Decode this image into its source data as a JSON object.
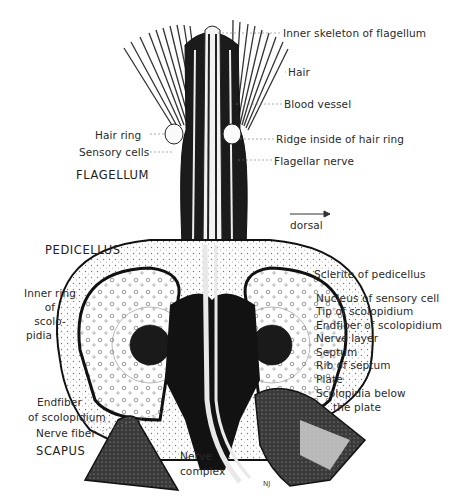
{
  "figure": {
    "colors": {
      "ink": "#1a1a1a",
      "paper": "#ffffff",
      "label": "#2a2a2a",
      "leader": "#555555"
    },
    "section_labels": {
      "flagellum": "FLAGELLUM",
      "pedicellus": "PEDICELLUS",
      "scapus": "SCAPUS"
    },
    "orientation": {
      "label": "dorsal",
      "arrow": "right-arrow"
    },
    "right_labels": [
      {
        "text": "Inner skeleton of flagellum"
      },
      {
        "text": "Hair"
      },
      {
        "text": "Blood vessel"
      },
      {
        "text": "Ridge inside of hair ring"
      },
      {
        "text": "Flagellar nerve"
      },
      {
        "text": "Sclerite of pedicellus"
      },
      {
        "text": "Nucleus of sensory cell"
      },
      {
        "text": "Tip of scolopidium"
      },
      {
        "text": "Endfiber of scolopidium"
      },
      {
        "text": "Nerve layer"
      },
      {
        "text": "Septum"
      },
      {
        "text": "Rib of septum"
      },
      {
        "text": "Plate"
      },
      {
        "text": "Scolopidia below"
      },
      {
        "text": "the plate"
      }
    ],
    "left_labels": [
      {
        "text": "Hair ring"
      },
      {
        "text": "Sensory cells"
      },
      {
        "text": "Inner ring"
      },
      {
        "text": "of"
      },
      {
        "text": "scolo-"
      },
      {
        "text": "pidia"
      },
      {
        "text": "Endfiber"
      },
      {
        "text": "of scolopidium"
      },
      {
        "text": "Nerve fiber"
      }
    ],
    "bottom_labels": [
      {
        "text": "Nerve"
      },
      {
        "text": "complex"
      }
    ],
    "signature": "NJ"
  }
}
